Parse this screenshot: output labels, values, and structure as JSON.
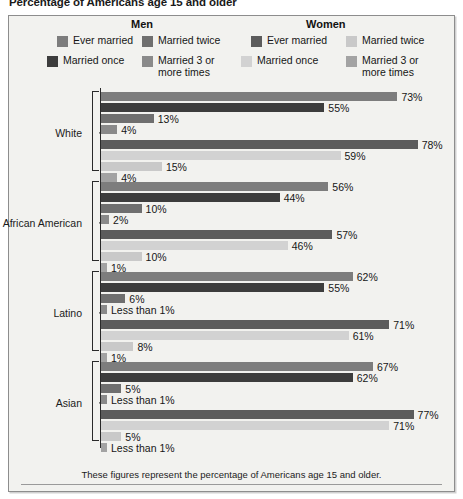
{
  "chart_title": "Percentage of Americans age 15 and older",
  "footnote": "These figures represent the percentage of Americans age 15 and older.",
  "legend": {
    "men_heading": "Men",
    "women_heading": "Women",
    "men": [
      {
        "label": "Ever married",
        "color": "#7d7d7d"
      },
      {
        "label": "Married twice",
        "color": "#6f6f6f"
      },
      {
        "label": "Married once",
        "color": "#3d3d3d"
      },
      {
        "label": "Married 3 or\nmore times",
        "color": "#8a8a8a"
      }
    ],
    "women": [
      {
        "label": "Ever married",
        "color": "#5c5c5c"
      },
      {
        "label": "Married twice",
        "color": "#c9c9c9"
      },
      {
        "label": "Married once",
        "color": "#d2d2d2"
      },
      {
        "label": "Married 3 or\nmore times",
        "color": "#a3a3a3"
      }
    ]
  },
  "chart_data": {
    "type": "bar",
    "title": "Percentage of Americans age 15 and older",
    "xlabel": "",
    "ylabel": "",
    "orientation": "horizontal",
    "xlim": [
      0,
      80
    ],
    "grid": false,
    "legend_position": "top",
    "categories": [
      "White",
      "African American",
      "Latino",
      "Asian"
    ],
    "series": [
      {
        "name": "Men: Ever married",
        "color": "#7d7d7d",
        "values": [
          73,
          56,
          62,
          67
        ],
        "labels": [
          "73%",
          "56%",
          "62%",
          "67%"
        ]
      },
      {
        "name": "Men: Married once",
        "color": "#3d3d3d",
        "values": [
          55,
          44,
          55,
          62
        ],
        "labels": [
          "55%",
          "44%",
          "55%",
          "62%"
        ]
      },
      {
        "name": "Men: Married twice",
        "color": "#6f6f6f",
        "values": [
          13,
          10,
          6,
          5
        ],
        "labels": [
          "13%",
          "10%",
          "6%",
          "5%"
        ]
      },
      {
        "name": "Men: Married 3 or more times",
        "color": "#8a8a8a",
        "values": [
          4,
          2,
          0.5,
          0.5
        ],
        "labels": [
          "4%",
          "2%",
          "Less than 1%",
          "Less than 1%"
        ]
      },
      {
        "name": "Women: Ever married",
        "color": "#5c5c5c",
        "values": [
          78,
          57,
          71,
          77
        ],
        "labels": [
          "78%",
          "57%",
          "71%",
          "77%"
        ]
      },
      {
        "name": "Women: Married once",
        "color": "#d2d2d2",
        "values": [
          59,
          46,
          61,
          71
        ],
        "labels": [
          "59%",
          "46%",
          "61%",
          "71%"
        ]
      },
      {
        "name": "Women: Married twice",
        "color": "#c9c9c9",
        "values": [
          15,
          10,
          8,
          5
        ],
        "labels": [
          "15%",
          "10%",
          "8%",
          "5%"
        ]
      },
      {
        "name": "Women: Married 3 or more times",
        "color": "#a3a3a3",
        "values": [
          4,
          1,
          1,
          0.5
        ],
        "labels": [
          "4%",
          "1%",
          "1%",
          "Less than 1%"
        ]
      }
    ]
  },
  "scale": {
    "px_per_percent": 4.06,
    "min_bar_px": 6
  }
}
